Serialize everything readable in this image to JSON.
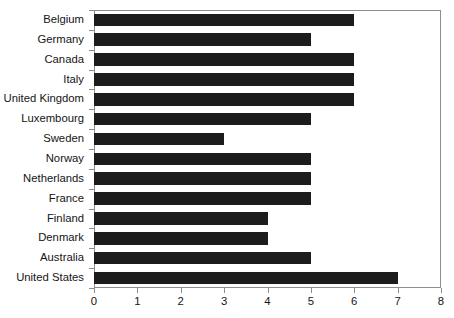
{
  "chart_data": {
    "type": "bar",
    "orientation": "horizontal",
    "title": "",
    "subtitle": "",
    "xlabel": "",
    "ylabel": "",
    "xlim": [
      0,
      8
    ],
    "xticks": [
      "0",
      "1",
      "2",
      "3",
      "4",
      "5",
      "6",
      "7",
      "8"
    ],
    "grid": false,
    "legend": false,
    "bar_color": "#1c1c1c",
    "axis_color": "#8e8e8e",
    "categories": [
      "Belgium",
      "Germany",
      "Canada",
      "Italy",
      "United Kingdom",
      "Luxembourg",
      "Sweden",
      "Norway",
      "Netherlands",
      "France",
      "Finland",
      "Denmark",
      "Australia",
      "United States"
    ],
    "values": [
      6,
      5,
      6,
      6,
      6,
      5,
      3,
      5,
      5,
      5,
      4,
      4,
      5,
      7
    ]
  }
}
